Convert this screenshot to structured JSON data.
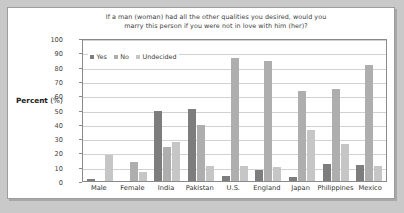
{
  "figure": {
    "y_axis_title_bold": "Percent",
    "y_axis_title_rest": " (%)"
  },
  "chart_data": {
    "type": "bar",
    "title": "If a man (woman) had all the other qualities you desired, would you marry this person if you were not in love with him (her)?",
    "title_line1": "If a man (woman) had all the other qualities you desired, would you",
    "title_line2": "marry this person if you were not in love with him (her)?",
    "xlabel": "",
    "ylabel": "Percent (%)",
    "ylim": [
      0,
      100
    ],
    "ytick_values": [
      0,
      10,
      20,
      30,
      40,
      50,
      60,
      70,
      80,
      90,
      100
    ],
    "ytick_labels": [
      "0",
      "10",
      "20",
      "30",
      "40",
      "50",
      "60",
      "70",
      "80",
      "90",
      "100"
    ],
    "grid": true,
    "legend_position": "top-left-inside",
    "categories": [
      "Male",
      "Female",
      "India",
      "Pakistan",
      "U.S.",
      "England",
      "Japan",
      "Philippines",
      "Mexico"
    ],
    "series": [
      {
        "name": "Yes",
        "color": "#7d7d7d",
        "values": [
          1.5,
          0,
          49,
          50.5,
          3.5,
          7.5,
          2.5,
          12,
          11
        ]
      },
      {
        "name": "No",
        "color": "#aeaeae",
        "values": [
          0,
          13,
          24,
          39,
          86,
          84,
          63,
          64,
          81
        ]
      },
      {
        "name": "Undecided",
        "color": "#c6c6c6",
        "values": [
          18,
          6.5,
          27,
          10.5,
          10.5,
          10,
          36,
          26,
          10.5
        ]
      }
    ]
  }
}
